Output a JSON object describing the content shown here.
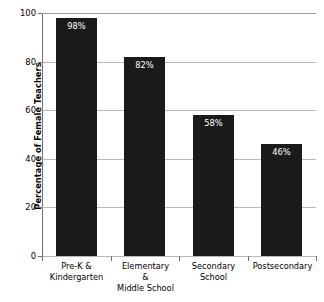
{
  "chart_data": {
    "type": "bar",
    "title": "",
    "xlabel": "",
    "ylabel": "Percentage of Female Teachers",
    "ylim": [
      0,
      100
    ],
    "yticks": [
      0,
      20,
      40,
      60,
      80,
      100
    ],
    "grid": true,
    "legend": false,
    "bar_color": "#1a1a1a",
    "value_label_color": "#ffffff",
    "categories": [
      "Pre-K &\nKindergarten",
      "Elementary\n&\nMiddle School",
      "Secondary\nSchool",
      "Postsecondary"
    ],
    "values": [
      98,
      82,
      58,
      46
    ],
    "value_labels": [
      "98%",
      "82%",
      "58%",
      "46%"
    ],
    "points": [
      {
        "category": "Pre-K & Kindergarten",
        "value": 98,
        "label": "98%"
      },
      {
        "category": "Elementary & Middle School",
        "value": 82,
        "label": "82%"
      },
      {
        "category": "Secondary School",
        "value": 58,
        "label": "58%"
      },
      {
        "category": "Postsecondary",
        "value": 46,
        "label": "46%"
      }
    ]
  },
  "axis": {
    "y_title": "Percentage of Female Teachers",
    "y_tick_labels": [
      "100",
      "80",
      "60",
      "40",
      "20",
      "0"
    ]
  },
  "categories_lines": [
    [
      "Pre-K &",
      "Kindergarten"
    ],
    [
      "Elementary",
      "&",
      "Middle School"
    ],
    [
      "Secondary",
      "School"
    ],
    [
      "Postsecondary"
    ]
  ]
}
